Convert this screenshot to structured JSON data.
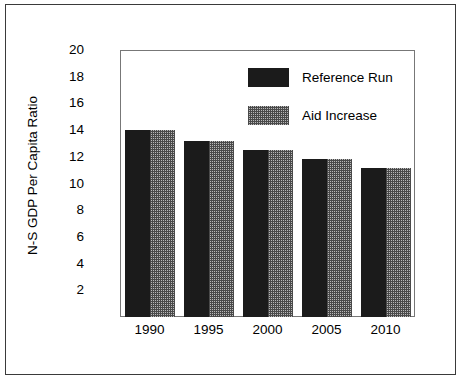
{
  "chart_data": {
    "type": "bar",
    "title": "",
    "subtitle": "",
    "xlabel": "",
    "ylabel": "N-S GDP Per Capita Ratio",
    "categories": [
      "1990",
      "1995",
      "2000",
      "2005",
      "2010"
    ],
    "series": [
      {
        "name": "Reference Run",
        "pattern": "solid-black",
        "color": "#1b1b1b",
        "values": [
          14.0,
          13.2,
          12.5,
          11.8,
          11.15
        ]
      },
      {
        "name": "Aid Increase",
        "pattern": "checkered-gray",
        "color": "#b9b9b9",
        "values": [
          14.0,
          13.2,
          12.5,
          11.8,
          11.15
        ]
      }
    ],
    "ylim": [
      0,
      20
    ],
    "y_axis_baseline": 0,
    "yticks": [
      2,
      4,
      6,
      8,
      10,
      12,
      14,
      16,
      18,
      20
    ],
    "ytick_labels": [
      "2",
      "4",
      "6",
      "8",
      "10",
      "12",
      "14",
      "16",
      "18",
      "20"
    ],
    "grid": false,
    "legend_position": "upper-right-inside",
    "frame": true
  },
  "axis": {
    "y_label": "N-S GDP Per Capita Ratio",
    "y_ticks": [
      "20",
      "18",
      "16",
      "14",
      "12",
      "10",
      "8",
      "6",
      "4",
      "2"
    ],
    "x_ticks": [
      "1990",
      "1995",
      "2000",
      "2005",
      "2010"
    ]
  },
  "legend": {
    "entries": [
      {
        "label": "Reference Run",
        "swatch": "solid-black-swatch"
      },
      {
        "label": "Aid Increase",
        "swatch": "checkered-gray-swatch"
      }
    ]
  },
  "colors": {
    "reference_run": "#1b1b1b",
    "aid_increase": "#b9b9b9",
    "frame": "#777777",
    "outer_border": "#3a3a3a",
    "background": "#ffffff",
    "text": "#000000"
  }
}
